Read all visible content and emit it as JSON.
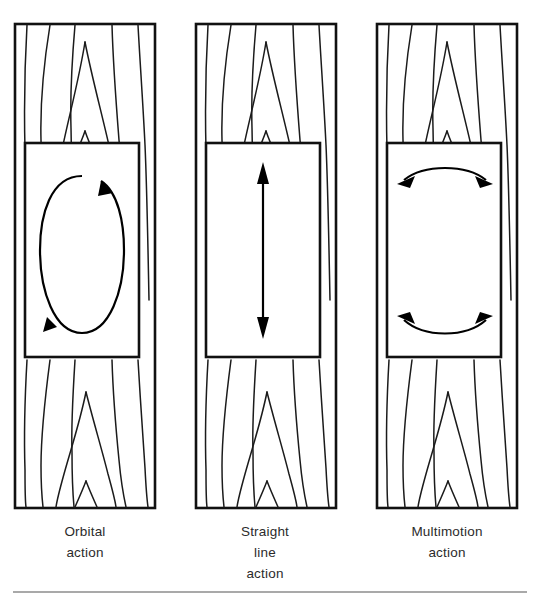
{
  "figure": {
    "background_color": "#ffffff",
    "line_color": "#111111",
    "rule_color": "#8d8d8d"
  },
  "panels": [
    {
      "id": "orbital",
      "caption": "Orbital\naction",
      "motion_icon": "orbital-ellipse-icon",
      "motion_description": "clockwise ellipse loop",
      "arrowheads": 2
    },
    {
      "id": "straight-line",
      "caption": "Straight\nline\naction",
      "motion_icon": "vertical-double-arrow-icon",
      "motion_description": "vertical double headed arrow",
      "arrowheads": 2
    },
    {
      "id": "multimotion",
      "caption": "Multimotion\naction",
      "motion_icon": "curved-double-arrow-icon",
      "motion_description": "two curved double headed arcs",
      "arrowheads": 4
    }
  ],
  "footer": {
    "rule_label": "horizontal-rule"
  }
}
